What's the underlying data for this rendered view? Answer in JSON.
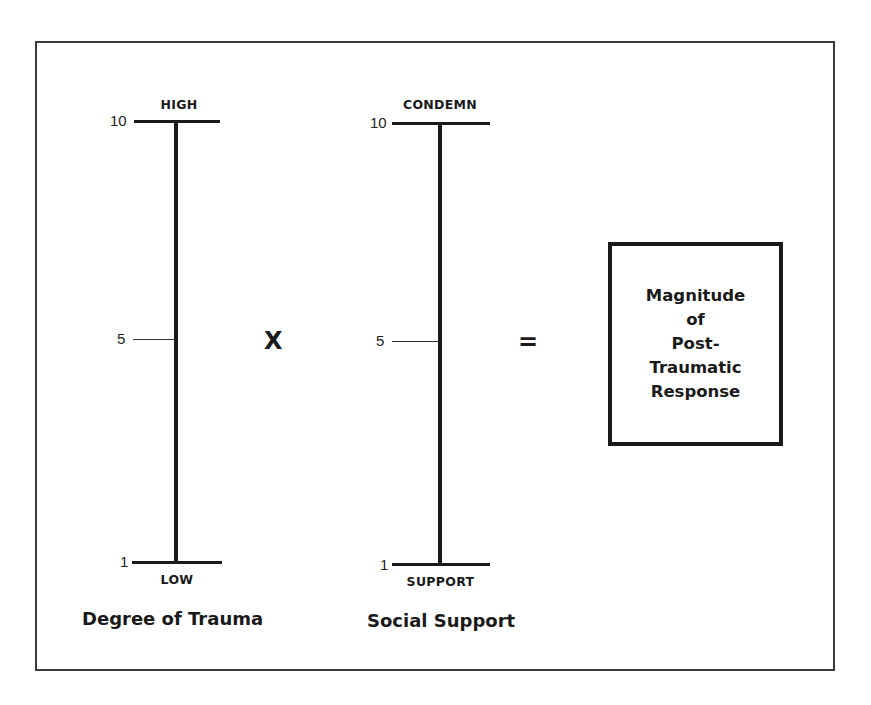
{
  "diagram": {
    "operator_multiply": "X",
    "operator_equals": "=",
    "scales": [
      {
        "title": "Degree of Trauma",
        "top_label": "HIGH",
        "bottom_label": "LOW",
        "ticks": {
          "top": "10",
          "middle": "5",
          "bottom": "1"
        }
      },
      {
        "title": "Social Support",
        "top_label": "CONDEMN",
        "bottom_label": "SUPPORT",
        "ticks": {
          "top": "10",
          "middle": "5",
          "bottom": "1"
        }
      }
    ],
    "result": {
      "lines": [
        "Magnitude",
        "of",
        "Post-",
        "Traumatic",
        "Response"
      ]
    }
  },
  "colors": {
    "ink": "#1a1a1a",
    "frame": "#3a3a3a",
    "background": "#ffffff"
  }
}
